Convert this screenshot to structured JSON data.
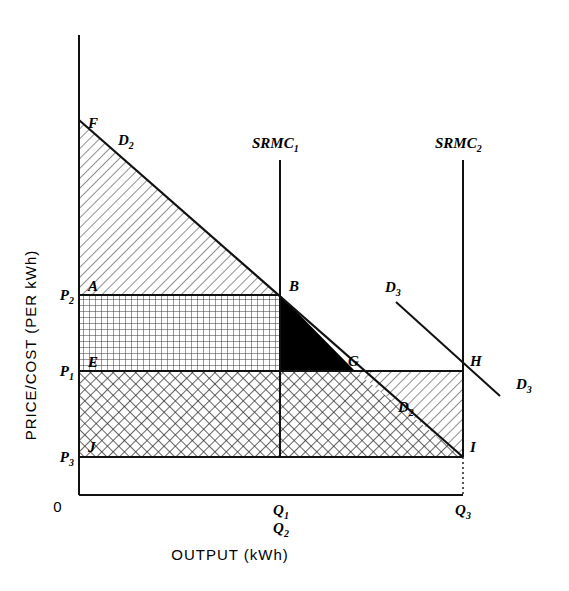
{
  "figure": {
    "axes": {
      "y_title": "PRICE/COST  (PER kWh)",
      "x_title": "OUTPUT  (kWh)",
      "origin_label": "0",
      "y_ticks": [
        {
          "id": "P2",
          "base": "P",
          "sub": "2",
          "y": 295
        },
        {
          "id": "P1",
          "base": "P",
          "sub": "1",
          "y": 371
        },
        {
          "id": "P3",
          "base": "P",
          "sub": "3",
          "y": 457
        }
      ],
      "x_ticks": [
        {
          "id": "Q1",
          "base": "Q",
          "sub": "1",
          "x": 280,
          "row": 0
        },
        {
          "id": "Q2",
          "base": "Q",
          "sub": "2",
          "x": 280,
          "row": 1
        },
        {
          "id": "Q3",
          "base": "Q",
          "sub": "3",
          "x": 463,
          "row": 0
        }
      ]
    },
    "curves": [
      {
        "name": "D2",
        "base": "D",
        "sub": "2",
        "kind": "demand",
        "labels": [
          {
            "x": 118,
            "y": 145
          },
          {
            "x": 398,
            "y": 412
          }
        ],
        "from": {
          "x": 79,
          "y": 120
        },
        "to": {
          "x": 463,
          "y": 457
        }
      },
      {
        "name": "D3",
        "base": "D",
        "sub": "3",
        "kind": "demand",
        "labels": [
          {
            "x": 385,
            "y": 292
          },
          {
            "x": 516,
            "y": 389
          }
        ],
        "from": {
          "x": 396,
          "y": 302
        },
        "to": {
          "x": 500,
          "y": 396
        }
      },
      {
        "name": "SRMC1",
        "base": "SRMC",
        "sub": "1",
        "kind": "marginal-cost",
        "labels": [
          {
            "x": 258,
            "y": 148
          }
        ],
        "x": 280,
        "top": 160,
        "bottom": 457
      },
      {
        "name": "SRMC2",
        "base": "SRMC",
        "sub": "2",
        "kind": "marginal-cost",
        "labels": [
          {
            "x": 441,
            "y": 148
          }
        ],
        "x": 463,
        "top": 160,
        "bottom": 457
      }
    ],
    "points": [
      {
        "id": "F",
        "x": 79,
        "y": 120,
        "lx": 88,
        "ly": 128
      },
      {
        "id": "A",
        "x": 79,
        "y": 295,
        "lx": 88,
        "ly": 291
      },
      {
        "id": "B",
        "x": 280,
        "y": 295,
        "lx": 289,
        "ly": 291
      },
      {
        "id": "E",
        "x": 79,
        "y": 371,
        "lx": 88,
        "ly": 367
      },
      {
        "id": "C",
        "x": 280,
        "y": 371,
        "lx": 289,
        "ly": 367
      },
      {
        "id": "G",
        "x": 355,
        "y": 371,
        "lx": 348,
        "ly": 366
      },
      {
        "id": "H",
        "x": 463,
        "y": 371,
        "lx": 470,
        "ly": 366
      },
      {
        "id": "J",
        "x": 79,
        "y": 457,
        "lx": 88,
        "ly": 452
      },
      {
        "id": "I",
        "x": 463,
        "y": 457,
        "lx": 470,
        "ly": 452
      }
    ],
    "regions": [
      {
        "id": "F-A-B-D2",
        "fill": "diagonal-hatch",
        "role": "consumer-surplus"
      },
      {
        "id": "A-B-C-E",
        "fill": "square-grid",
        "role": "revenue-band-P2-P1"
      },
      {
        "id": "E-C-G-I-J",
        "fill": "cross-hatch",
        "role": "revenue-band-P1-P3"
      },
      {
        "id": "B-C-G",
        "fill": "solid-black",
        "role": "deadweight-loss"
      },
      {
        "id": "G-H-I",
        "fill": "diagonal-hatch",
        "role": "surplus-triangle"
      }
    ]
  }
}
